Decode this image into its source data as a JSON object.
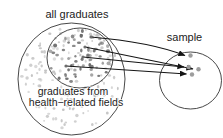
{
  "diagram": {
    "labels": {
      "population": "all graduates",
      "subgroup_line1": "graduates from",
      "subgroup_line2": "health−related fields",
      "sample": "sample"
    },
    "colors": {
      "background": "#ffffff",
      "outline": "#333333",
      "arrow": "#151515",
      "text": "#222222",
      "population_dot": "#c3c3c3",
      "subgroup_dot": "#6d6d6d",
      "sample_dot": "#9d9d9d"
    },
    "circles": {
      "population": {
        "cx": 71.5,
        "cy": 79,
        "rx": 53.5,
        "ry": 56
      },
      "subgroup": {
        "cx": 80,
        "cy": 58,
        "rx": 33,
        "ry": 30
      },
      "sample": {
        "cx": 190.5,
        "cy": 80.5,
        "rx": 31,
        "ry": 28.5
      }
    },
    "dots": {
      "population": {
        "count": 150,
        "seed": 7,
        "r_min": 0.9,
        "r_max": 1.8
      },
      "subgroup": {
        "count": 58,
        "seed": 13,
        "r_min": 1.1,
        "r_max": 2.1
      }
    },
    "sample_dots": [
      [
        190.5,
        55.5
      ],
      [
        188.7,
        67.0
      ],
      [
        198.5,
        69.3
      ],
      [
        192.0,
        74.5
      ]
    ],
    "arrows": [
      {
        "x1": 91,
        "y1": 37,
        "x2": 185,
        "y2": 55.5,
        "qx": 150,
        "qy": 42
      },
      {
        "x1": 85,
        "y1": 47,
        "x2": 193,
        "y2": 69
      },
      {
        "x1": 83,
        "y1": 57,
        "x2": 184,
        "y2": 67
      },
      {
        "x1": 66,
        "y1": 66,
        "x2": 186.5,
        "y2": 74
      }
    ]
  }
}
